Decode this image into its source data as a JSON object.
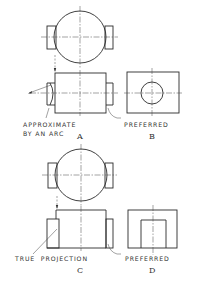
{
  "figure": {
    "panels": [
      {
        "id": "A",
        "letter": "A",
        "label_lines": [
          "APPROXIMATE",
          "BY AN ARC"
        ]
      },
      {
        "id": "B",
        "letter": "B",
        "label_lines": [
          "PREFERRED"
        ]
      },
      {
        "id": "C",
        "letter": "C",
        "label_lines": [
          "TRUE  PROJECTION"
        ]
      },
      {
        "id": "D",
        "letter": "D",
        "label_lines": [
          "PREFERRED"
        ]
      }
    ]
  },
  "colors": {
    "line": "#2a2a2a",
    "background": "#ffffff"
  }
}
